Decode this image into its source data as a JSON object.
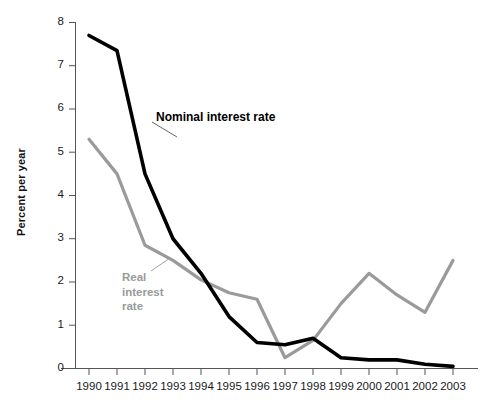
{
  "chart_data": {
    "type": "line",
    "title": "",
    "xlabel": "",
    "ylabel": "Percent per year",
    "x": [
      1990,
      1991,
      1992,
      1993,
      1994,
      1995,
      1996,
      1997,
      1998,
      1999,
      2000,
      2001,
      2002,
      2003
    ],
    "categories": [
      "1990",
      "1991",
      "1992",
      "1993",
      "1994",
      "1995",
      "1996",
      "1997",
      "1998",
      "1999",
      "2000",
      "2001",
      "2002",
      "2003"
    ],
    "series": [
      {
        "name": "Nominal interest rate",
        "color": "#000000",
        "values": [
          7.7,
          7.35,
          4.5,
          3.0,
          2.2,
          1.2,
          0.6,
          0.55,
          0.7,
          0.25,
          0.2,
          0.2,
          0.1,
          0.05
        ]
      },
      {
        "name": "Real interest rate",
        "color": "#9a9a9a",
        "values": [
          5.3,
          4.5,
          2.85,
          2.5,
          2.05,
          1.75,
          1.6,
          0.25,
          0.65,
          1.5,
          2.2,
          1.7,
          1.3,
          2.5
        ]
      }
    ],
    "ylim": [
      0,
      8
    ],
    "yticks": [
      0,
      1,
      2,
      3,
      4,
      5,
      6,
      7,
      8
    ],
    "ytick_labels": [
      "0",
      "1",
      "2",
      "3",
      "4",
      "5",
      "6",
      "7",
      "8"
    ],
    "xlim": [
      1990,
      2003
    ],
    "grid": false,
    "legend_position": "inline-annotations",
    "annotations": [
      {
        "name": "nominal-series-label",
        "text": "Nominal interest rate",
        "color": "#000000",
        "leader_line": true
      },
      {
        "name": "real-series-label",
        "text_lines": [
          "Real",
          "interest",
          "rate"
        ],
        "color": "#9a9a9a",
        "leader_line": true
      }
    ]
  },
  "labels": {
    "y_axis_title": "Percent per year",
    "nominal_annotation": "Nominal interest rate",
    "real_annotation_line1": "Real",
    "real_annotation_line2": "interest",
    "real_annotation_line3": "rate"
  }
}
